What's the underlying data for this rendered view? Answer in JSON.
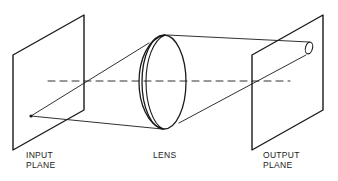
{
  "diagram": {
    "type": "optical-system",
    "labels": {
      "input_plane_line1": "INPUT",
      "input_plane_line2": "PLANE",
      "lens": "LENS",
      "output_plane_line1": "OUTPUT",
      "output_plane_line2": "PLANE"
    },
    "colors": {
      "stroke": "#1a1a1a",
      "background": "#ffffff"
    }
  }
}
